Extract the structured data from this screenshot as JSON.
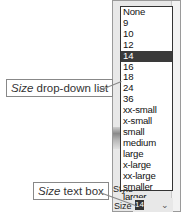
{
  "callouts": {
    "dropdown": {
      "italic": "Size",
      "rest": " drop-down list"
    },
    "textbox": {
      "italic": "Size",
      "rest": " text box"
    }
  },
  "size_list": {
    "options": [
      "None",
      "9",
      "10",
      "12",
      "14",
      "16",
      "18",
      "24",
      "36",
      "xx-small",
      "x-small",
      "small",
      "medium",
      "large",
      "x-large",
      "xx-large",
      "smaller",
      "larger"
    ],
    "selected": "14"
  },
  "labels": {
    "style": "Style",
    "size": "Size"
  },
  "size_field": {
    "value": "14",
    "arrow": "⌄"
  }
}
